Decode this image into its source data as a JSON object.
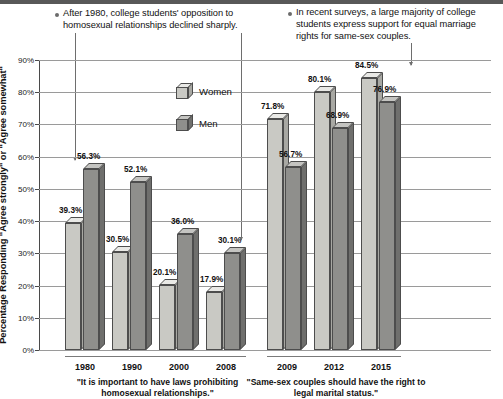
{
  "bullets": [
    {
      "id": "bullet-left",
      "text": "After 1980, college students' opposition to homosexual relationships declined sharply."
    },
    {
      "id": "bullet-right",
      "text": "In recent surveys, a large majority of college students express support for equal marriage rights for same-sex couples."
    }
  ],
  "legend": {
    "position": "inside-plot-upper-center",
    "items": [
      {
        "label": "Women",
        "color": "#c9c9c4"
      },
      {
        "label": "Men",
        "color": "#8f8f8c"
      }
    ]
  },
  "chart_data": {
    "type": "bar",
    "title": "",
    "xlabel": "",
    "ylabel": "Percentage Responding \"Agree strongly\" or \"Agree somewhat\"",
    "ylim": [
      0,
      90
    ],
    "ytick_step": 10,
    "yticks": [
      "0%",
      "10%",
      "20%",
      "30%",
      "40%",
      "50%",
      "60%",
      "70%",
      "80%",
      "90%"
    ],
    "grid": true,
    "grid_axis": "y",
    "categories": [
      "1980",
      "1990",
      "2000",
      "2008",
      "2009",
      "2012",
      "2015"
    ],
    "series": [
      {
        "name": "Women",
        "values": [
          39.3,
          30.5,
          20.1,
          17.9,
          71.8,
          80.1,
          84.5
        ]
      },
      {
        "name": "Men",
        "values": [
          56.3,
          52.1,
          36.0,
          30.1,
          56.7,
          68.9,
          76.9
        ]
      }
    ],
    "value_labels": [
      "39.3%",
      "56.3%",
      "30.5%",
      "52.1%",
      "20.1%",
      "36.0%",
      "17.9%",
      "30.1%",
      "71.8%",
      "56.7%",
      "80.1%",
      "68.9%",
      "84.5%",
      "76.9%"
    ],
    "groups": [
      {
        "name": "group-1",
        "caption": "\"It is important to have laws prohibiting homosexual relationships.\"",
        "categories": [
          "1980",
          "1990",
          "2000",
          "2008"
        ]
      },
      {
        "name": "group-2",
        "caption": "\"Same-sex couples should have the right to legal marital status.\"",
        "categories": [
          "2009",
          "2012",
          "2015"
        ]
      }
    ]
  }
}
